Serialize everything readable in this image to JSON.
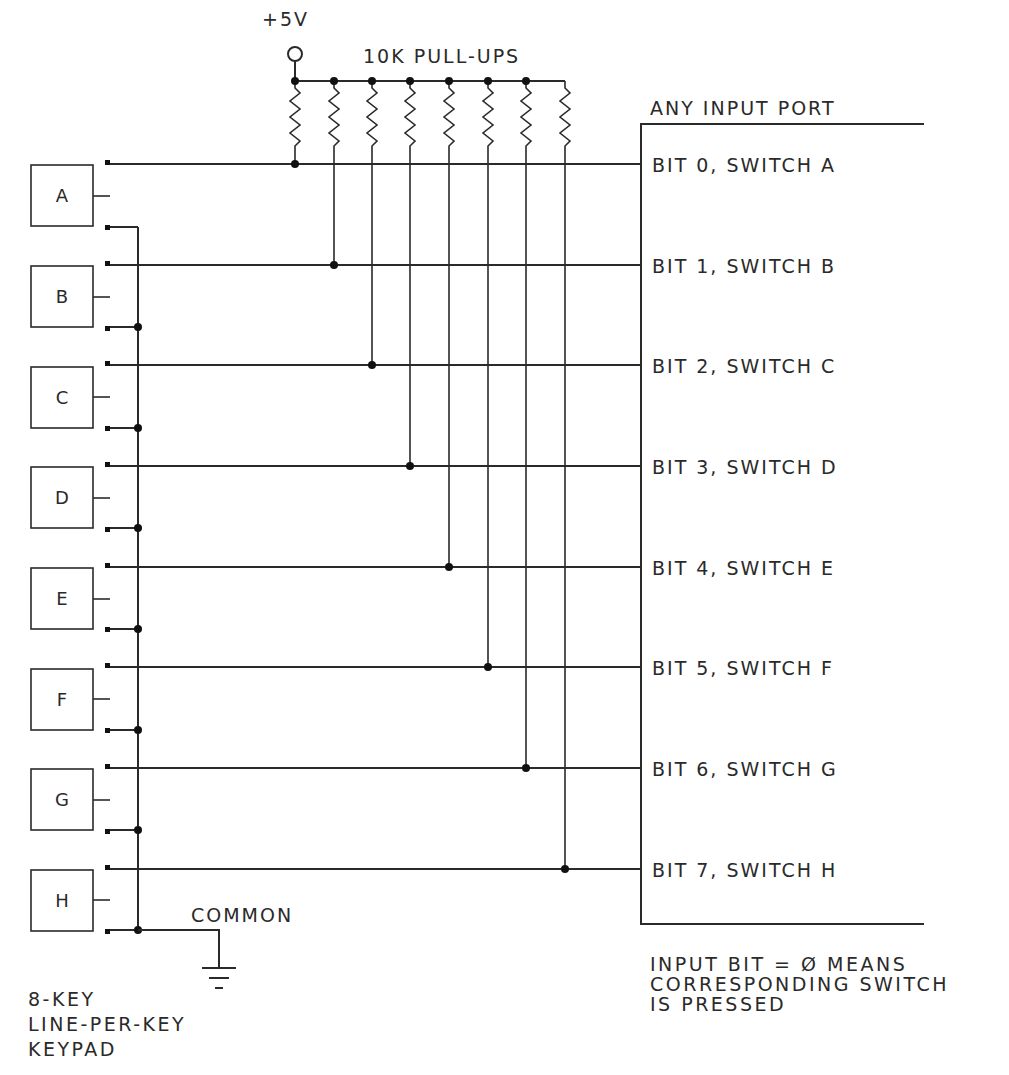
{
  "diagram": {
    "supply": {
      "label": "+5V"
    },
    "pullups": {
      "label": "10K PULL-UPS",
      "count": 8,
      "value": "10K"
    },
    "port": {
      "label": "ANY INPUT PORT"
    },
    "keys": [
      {
        "label": "A",
        "bit_label": "BIT 0, SWITCH A"
      },
      {
        "label": "B",
        "bit_label": "BIT 1, SWITCH B"
      },
      {
        "label": "C",
        "bit_label": "BIT 2, SWITCH C"
      },
      {
        "label": "D",
        "bit_label": "BIT 3, SWITCH D"
      },
      {
        "label": "E",
        "bit_label": "BIT 4, SWITCH E"
      },
      {
        "label": "F",
        "bit_label": "BIT 5, SWITCH F"
      },
      {
        "label": "G",
        "bit_label": "BIT 6, SWITCH G"
      },
      {
        "label": "H",
        "bit_label": "BIT 7, SWITCH H"
      }
    ],
    "common": {
      "label": "COMMON"
    },
    "keypad_caption": {
      "line1": "8-KEY",
      "line2": "LINE-PER-KEY",
      "line3": "KEYPAD"
    },
    "note": {
      "line1": "INPUT BIT = Ø MEANS",
      "line2": "CORRESPONDING SWITCH",
      "line3": "IS PRESSED"
    },
    "colors": {
      "ink": "#2a2a2a",
      "background": "#ffffff"
    }
  }
}
